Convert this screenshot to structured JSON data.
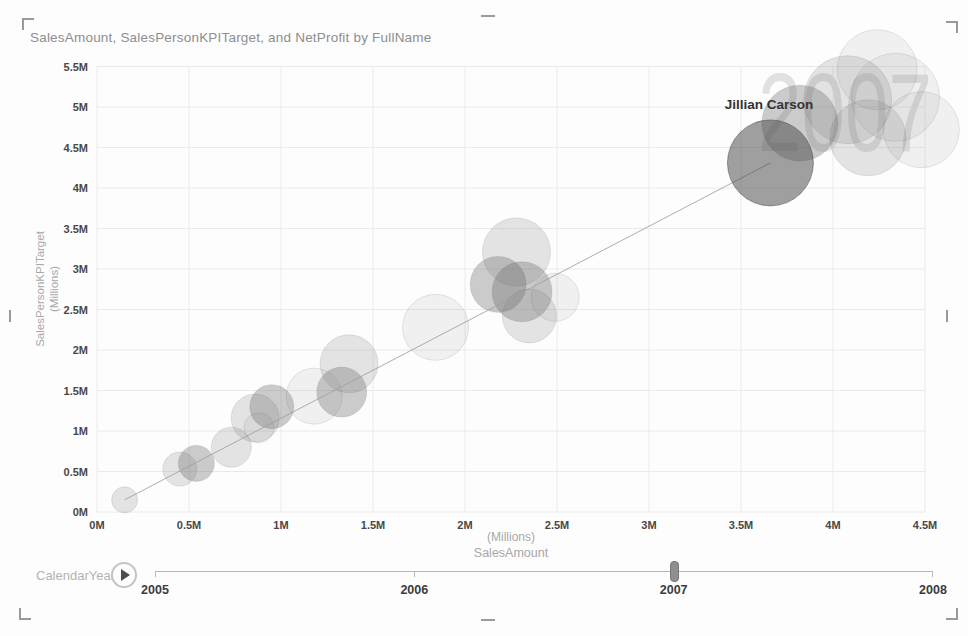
{
  "title": "SalesAmount, SalesPersonKPITarget, and NetProfit by FullName",
  "chart_data": {
    "type": "scatter",
    "title": "SalesAmount, SalesPersonKPITarget, and NetProfit by FullName",
    "xlabel": "SalesAmount",
    "xlabel_unit": "(Millions)",
    "ylabel": "SalesPersonKPITarget",
    "ylabel_unit": "(Millions)",
    "xlim": [
      0,
      4.5
    ],
    "ylim": [
      0,
      5.5
    ],
    "x_ticks": [
      "0M",
      "0.5M",
      "1M",
      "1.5M",
      "2M",
      "2.5M",
      "3M",
      "3.5M",
      "4M",
      "4.5M"
    ],
    "y_ticks": [
      "0M",
      "0.5M",
      "1M",
      "1.5M",
      "2M",
      "2.5M",
      "3M",
      "3.5M",
      "4M",
      "4.5M",
      "5M",
      "5.5M"
    ],
    "grid": true,
    "legend": "none",
    "watermark_year": "2007",
    "highlight": {
      "label": "Jillian Carson",
      "x": 3.66,
      "y": 4.31
    },
    "trail": {
      "x1": 0.15,
      "y1": 0.15,
      "x2": 3.66,
      "y2": 4.31
    },
    "bubbles": [
      {
        "x": 0.15,
        "y": 0.15,
        "r": 13,
        "shade": "light"
      },
      {
        "x": 0.45,
        "y": 0.53,
        "r": 17,
        "shade": "light"
      },
      {
        "x": 0.54,
        "y": 0.6,
        "r": 18,
        "shade": "medium"
      },
      {
        "x": 0.73,
        "y": 0.8,
        "r": 20,
        "shade": "light"
      },
      {
        "x": 0.88,
        "y": 1.04,
        "r": 15,
        "shade": "pale"
      },
      {
        "x": 0.86,
        "y": 1.16,
        "r": 24,
        "shade": "light"
      },
      {
        "x": 0.95,
        "y": 1.3,
        "r": 22,
        "shade": "medium"
      },
      {
        "x": 1.18,
        "y": 1.43,
        "r": 28,
        "shade": "pale"
      },
      {
        "x": 1.33,
        "y": 1.48,
        "r": 25,
        "shade": "medium"
      },
      {
        "x": 1.37,
        "y": 1.83,
        "r": 29,
        "shade": "light"
      },
      {
        "x": 1.84,
        "y": 2.28,
        "r": 33,
        "shade": "pale"
      },
      {
        "x": 2.28,
        "y": 3.21,
        "r": 34,
        "shade": "light"
      },
      {
        "x": 2.18,
        "y": 2.81,
        "r": 28,
        "shade": "medium"
      },
      {
        "x": 2.31,
        "y": 2.72,
        "r": 30,
        "shade": "medium"
      },
      {
        "x": 2.35,
        "y": 2.42,
        "r": 27,
        "shade": "light"
      },
      {
        "x": 2.49,
        "y": 2.65,
        "r": 24,
        "shade": "pale"
      },
      {
        "x": 3.82,
        "y": 4.8,
        "r": 38,
        "shade": "medium"
      },
      {
        "x": 4.08,
        "y": 5.09,
        "r": 44,
        "shade": "light"
      },
      {
        "x": 4.19,
        "y": 4.62,
        "r": 38,
        "shade": "light"
      },
      {
        "x": 4.34,
        "y": 5.12,
        "r": 44,
        "shade": "pale"
      },
      {
        "x": 4.48,
        "y": 4.72,
        "r": 38,
        "shade": "pale"
      },
      {
        "x": 4.24,
        "y": 5.46,
        "r": 40,
        "shade": "pale"
      },
      {
        "x": 3.66,
        "y": 4.31,
        "r": 43,
        "shade": "dark",
        "label": "Jillian Carson"
      }
    ]
  },
  "play_axis": {
    "label": "CalendarYear",
    "years": [
      "2005",
      "2006",
      "2007",
      "2008"
    ],
    "current_year": "2007",
    "icons": {
      "play": "▶"
    }
  },
  "colors": {
    "shades": {
      "pale": "rgba(125,125,125,0.10)",
      "light": "rgba(115,115,115,0.19)",
      "medium": "rgba(100,100,100,0.32)",
      "dark": "rgba(72,72,72,0.52)"
    },
    "bubble_stroke": "rgba(100,100,100,0.16)",
    "dark_stroke": "rgba(60,60,60,0.45)",
    "watermark": "#e1e1e1",
    "grid": "#eaeaea",
    "tick_text": "#484848",
    "muted_text": "#a8a8a8",
    "label_text": "#333333",
    "trail": "#a0a0a0",
    "handle": "#9a9a9a"
  }
}
